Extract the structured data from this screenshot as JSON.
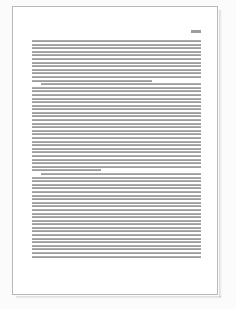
{
  "viewport": {
    "width": 236,
    "height": 309,
    "background_color": "#fbfbfb"
  },
  "page": {
    "kind": "document-page-thumbnail",
    "sheet_color": "#ffffff",
    "border_color": "#b8b8b8",
    "left": 12,
    "top": 6,
    "width": 206,
    "height": 289,
    "has_drop_shadow": true
  },
  "header": {
    "mark_label": "",
    "mark_color": "#9d9d9d",
    "mark_width": 10,
    "mark_height": 3,
    "icon": "running-head-mark"
  },
  "body": {
    "text_color": "#9c9c9c",
    "line_height": 2,
    "line_gap": 1.6,
    "column_left": 31,
    "column_right": 200,
    "paragraphs": [
      {
        "id": "paragraph-1",
        "first_line_indent": false,
        "lines": [
          {
            "width_pct": 100
          },
          {
            "width_pct": 100
          },
          {
            "width_pct": 100
          },
          {
            "width_pct": 100
          },
          {
            "width_pct": 100
          },
          {
            "width_pct": 100
          },
          {
            "width_pct": 100
          },
          {
            "width_pct": 100
          },
          {
            "width_pct": 100
          },
          {
            "width_pct": 100
          },
          {
            "width_pct": 100
          },
          {
            "width_pct": 71
          }
        ]
      },
      {
        "id": "paragraph-2",
        "first_line_indent": true,
        "lines": [
          {
            "width_pct": 100,
            "indent": true
          },
          {
            "width_pct": 100
          },
          {
            "width_pct": 100
          },
          {
            "width_pct": 100
          },
          {
            "width_pct": 100
          },
          {
            "width_pct": 100
          },
          {
            "width_pct": 100
          },
          {
            "width_pct": 100
          },
          {
            "width_pct": 100
          },
          {
            "width_pct": 100
          },
          {
            "width_pct": 100
          },
          {
            "width_pct": 100
          },
          {
            "width_pct": 100
          },
          {
            "width_pct": 100
          },
          {
            "width_pct": 100
          },
          {
            "width_pct": 100
          },
          {
            "width_pct": 100
          },
          {
            "width_pct": 100
          },
          {
            "width_pct": 100
          },
          {
            "width_pct": 100
          },
          {
            "width_pct": 100
          },
          {
            "width_pct": 100
          },
          {
            "width_pct": 100
          },
          {
            "width_pct": 100
          },
          {
            "width_pct": 41
          }
        ]
      },
      {
        "id": "paragraph-3",
        "first_line_indent": true,
        "lines": [
          {
            "width_pct": 100,
            "indent": true
          },
          {
            "width_pct": 100
          },
          {
            "width_pct": 100
          },
          {
            "width_pct": 100
          },
          {
            "width_pct": 100
          },
          {
            "width_pct": 100
          },
          {
            "width_pct": 100
          },
          {
            "width_pct": 100
          },
          {
            "width_pct": 100
          },
          {
            "width_pct": 100
          },
          {
            "width_pct": 100
          },
          {
            "width_pct": 100
          },
          {
            "width_pct": 100
          },
          {
            "width_pct": 100
          },
          {
            "width_pct": 100
          },
          {
            "width_pct": 100
          },
          {
            "width_pct": 100
          },
          {
            "width_pct": 100
          },
          {
            "width_pct": 100
          },
          {
            "width_pct": 100
          },
          {
            "width_pct": 100
          },
          {
            "width_pct": 100
          },
          {
            "width_pct": 100
          },
          {
            "width_pct": 100
          }
        ]
      }
    ]
  }
}
